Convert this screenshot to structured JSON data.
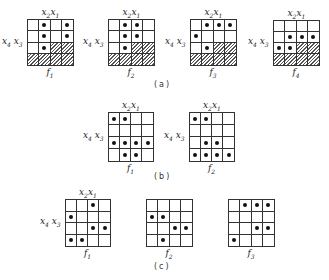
{
  "labels": {
    "x2": "x",
    "x2_sub": "2",
    "x1": "x",
    "x1_sub": "1",
    "x4": "x",
    "x4_sub": "4",
    "x3": "x",
    "x3_sub": "3",
    "f": "f"
  },
  "captions": {
    "a": "(a)",
    "b": "(b)",
    "c": "(c)"
  },
  "sections": {
    "a": [
      {
        "name": "f1",
        "sub": "1",
        "rows": [
          [
            0,
            1,
            0,
            1
          ],
          [
            0,
            1,
            0,
            1
          ],
          [
            0,
            1,
            "h",
            "h"
          ],
          [
            "h",
            "h",
            "h",
            "h"
          ]
        ]
      },
      {
        "name": "f2",
        "sub": "2",
        "rows": [
          [
            0,
            1,
            1,
            0
          ],
          [
            0,
            1,
            1,
            0
          ],
          [
            0,
            1,
            "h",
            "h"
          ],
          [
            "h",
            "h",
            "h",
            "h"
          ]
        ]
      },
      {
        "name": "f3",
        "sub": "3",
        "rows": [
          [
            0,
            1,
            1,
            1
          ],
          [
            1,
            0,
            0,
            0
          ],
          [
            0,
            1,
            "h",
            "h"
          ],
          [
            "h",
            "h",
            "h",
            "h"
          ]
        ]
      },
      {
        "name": "f4",
        "sub": "4",
        "rows": [
          [
            0,
            0,
            0,
            0
          ],
          [
            0,
            1,
            1,
            1
          ],
          [
            1,
            1,
            "h",
            "h"
          ],
          [
            "h",
            "h",
            "h",
            "h"
          ]
        ]
      }
    ],
    "b": [
      {
        "name": "f1",
        "sub": "1",
        "rows": [
          [
            1,
            1,
            0,
            0
          ],
          [
            0,
            0,
            0,
            0
          ],
          [
            1,
            1,
            1,
            1
          ],
          [
            0,
            1,
            1,
            0
          ]
        ]
      },
      {
        "name": "f2",
        "sub": "2",
        "rows": [
          [
            1,
            1,
            0,
            0
          ],
          [
            0,
            0,
            0,
            0
          ],
          [
            0,
            1,
            1,
            0
          ],
          [
            1,
            1,
            1,
            1
          ]
        ]
      }
    ],
    "c": [
      {
        "name": "f1",
        "sub": "1",
        "rows": [
          [
            0,
            0,
            1,
            0
          ],
          [
            1,
            0,
            0,
            0
          ],
          [
            0,
            0,
            1,
            1
          ],
          [
            1,
            1,
            0,
            0
          ]
        ]
      },
      {
        "name": "f2",
        "sub": "2",
        "rows": [
          [
            0,
            0,
            0,
            0
          ],
          [
            1,
            1,
            0,
            0
          ],
          [
            0,
            0,
            1,
            1
          ],
          [
            0,
            1,
            0,
            0
          ]
        ]
      },
      {
        "name": "f3",
        "sub": "3",
        "rows": [
          [
            0,
            1,
            1,
            1
          ],
          [
            0,
            0,
            0,
            0
          ],
          [
            0,
            0,
            1,
            1
          ],
          [
            1,
            0,
            0,
            0
          ]
        ]
      }
    ]
  },
  "legend": {
    "dot": "1-cell",
    "hatch": "don't-care / unused cell"
  }
}
